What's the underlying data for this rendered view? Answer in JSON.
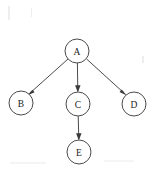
{
  "diagram": {
    "type": "directed-graph",
    "title": "",
    "background_color": "#ffffff",
    "node_stroke_color": "#4a4a4a",
    "node_fill_color": "#ffffff",
    "edge_color": "#4a4a4a",
    "label_color": "#222222",
    "node_radius": 12,
    "nodes": [
      {
        "id": "A",
        "label": "A",
        "cx": 77,
        "cy": 51,
        "r": 12
      },
      {
        "id": "B",
        "label": "B",
        "cx": 21,
        "cy": 103,
        "r": 12
      },
      {
        "id": "C",
        "label": "C",
        "cx": 78,
        "cy": 104,
        "r": 12
      },
      {
        "id": "D",
        "label": "D",
        "cx": 134,
        "cy": 104,
        "r": 12
      },
      {
        "id": "E",
        "label": "E",
        "cx": 79,
        "cy": 152,
        "r": 12
      }
    ],
    "edges": [
      {
        "from": "A",
        "to": "B",
        "directed": true,
        "x1": 68,
        "y1": 59,
        "x2": 28,
        "y2": 95
      },
      {
        "from": "A",
        "to": "C",
        "directed": true,
        "x1": 77,
        "y1": 63,
        "x2": 78,
        "y2": 92
      },
      {
        "from": "A",
        "to": "D",
        "directed": true,
        "x1": 87,
        "y1": 59,
        "x2": 126,
        "y2": 95
      },
      {
        "from": "C",
        "to": "E",
        "directed": true,
        "x1": 78,
        "y1": 116,
        "x2": 79,
        "y2": 140
      }
    ]
  }
}
